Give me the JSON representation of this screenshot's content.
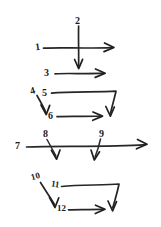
{
  "figure": {
    "background_color": "#ffffff",
    "ink_color": "#262626",
    "style": "hand-drawn pen sketch",
    "width": 161,
    "height": 227,
    "label_count": 12
  },
  "labels": {
    "n1": "1",
    "n2": "2",
    "n3": "3",
    "n4": "4",
    "n5": "5",
    "n6": "6",
    "n7": "7",
    "n8": "8",
    "n9": "9",
    "n10": "10",
    "n11": "11",
    "n12": "12"
  },
  "groups": [
    {
      "name": "group-top-crossing",
      "labels": [
        "1",
        "2",
        "3"
      ],
      "description": "A long horizontal arrow pointing right (1) is crossed by a vertical arrow pointing down (2); below them a shorter horizontal arrow points right (3)."
    },
    {
      "name": "group-second-loop",
      "labels": [
        "4",
        "5",
        "6"
      ],
      "description": "A short diagonal arrow points down-right (4) into label 6; a long line (5) runs right then bends down-left into an arrowhead; a horizontal arrow (6) points right to that same arrowhead."
    },
    {
      "name": "group-third-baseline",
      "labels": [
        "7",
        "8",
        "9"
      ],
      "description": "A long horizontal arrow pointing right (7) with two short arrows branching downward from it, labelled 8 and 9."
    },
    {
      "name": "group-bottom-loop",
      "labels": [
        "10",
        "11",
        "12"
      ],
      "description": "A diagonal arrow points down-right (10) into label 12; a long line (11) runs right then bends down-left into an arrowhead; a horizontal arrow (12) points right to that arrowhead."
    }
  ],
  "arrows": [
    {
      "id": "arrow-1",
      "label": "1",
      "direction": "right",
      "kind": "horizontal-long"
    },
    {
      "id": "arrow-2",
      "label": "2",
      "direction": "down",
      "kind": "vertical"
    },
    {
      "id": "arrow-3",
      "label": "3",
      "direction": "right",
      "kind": "horizontal-short"
    },
    {
      "id": "arrow-4",
      "label": "4",
      "direction": "down-right",
      "kind": "diagonal-short"
    },
    {
      "id": "arrow-5",
      "label": "5",
      "direction": "right-then-down-left",
      "kind": "bent-polyline"
    },
    {
      "id": "arrow-6",
      "label": "6",
      "direction": "right",
      "kind": "horizontal-short"
    },
    {
      "id": "arrow-7",
      "label": "7",
      "direction": "right",
      "kind": "horizontal-long"
    },
    {
      "id": "arrow-8",
      "label": "8",
      "direction": "down-right",
      "kind": "branch-short"
    },
    {
      "id": "arrow-9",
      "label": "9",
      "direction": "down-left",
      "kind": "branch-short"
    },
    {
      "id": "arrow-10",
      "label": "10",
      "direction": "down-right",
      "kind": "diagonal-long"
    },
    {
      "id": "arrow-11",
      "label": "11",
      "direction": "right-then-down-left",
      "kind": "bent-polyline"
    },
    {
      "id": "arrow-12",
      "label": "12",
      "direction": "right",
      "kind": "horizontal-short"
    }
  ]
}
